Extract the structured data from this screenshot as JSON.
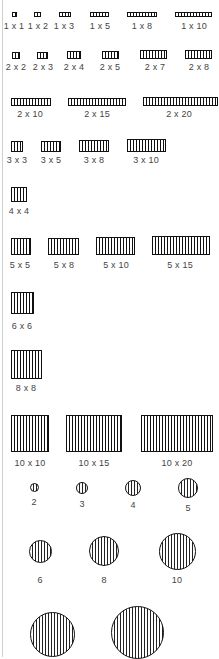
{
  "rects": [
    {
      "label": "1 x 1",
      "x": 12,
      "y": 12,
      "w": 5,
      "h": 5,
      "lx": 14,
      "ly": 21
    },
    {
      "label": "1 x 2",
      "x": 34,
      "y": 12,
      "w": 7,
      "h": 5,
      "lx": 38,
      "ly": 21
    },
    {
      "label": "1 x 3",
      "x": 59,
      "y": 12,
      "w": 12,
      "h": 5,
      "lx": 64,
      "ly": 21
    },
    {
      "label": "1 x 5",
      "x": 90,
      "y": 12,
      "w": 19,
      "h": 5,
      "lx": 100,
      "ly": 21
    },
    {
      "label": "1 x 8",
      "x": 127,
      "y": 12,
      "w": 30,
      "h": 5,
      "lx": 142,
      "ly": 21
    },
    {
      "label": "1 x 10",
      "x": 175,
      "y": 12,
      "w": 37,
      "h": 5,
      "lx": 194,
      "ly": 21
    },
    {
      "label": "2 x 2",
      "x": 12,
      "y": 52,
      "w": 8,
      "h": 7,
      "lx": 16,
      "ly": 62
    },
    {
      "label": "2 x 3",
      "x": 37,
      "y": 52,
      "w": 11,
      "h": 7,
      "lx": 43,
      "ly": 62
    },
    {
      "label": "2 x 4",
      "x": 67,
      "y": 51,
      "w": 14,
      "h": 8,
      "lx": 74,
      "ly": 62
    },
    {
      "label": "2 x 5",
      "x": 102,
      "y": 51,
      "w": 17,
      "h": 8,
      "lx": 110,
      "ly": 62
    },
    {
      "label": "2 x 7",
      "x": 140,
      "y": 50,
      "w": 27,
      "h": 9,
      "lx": 155,
      "ly": 62
    },
    {
      "label": "2 x 8",
      "x": 185,
      "y": 50,
      "w": 27,
      "h": 9,
      "lx": 199,
      "ly": 62
    },
    {
      "label": "2 x 10",
      "x": 11,
      "y": 98,
      "w": 40,
      "h": 8,
      "lx": 30,
      "ly": 109
    },
    {
      "label": "2 x 15",
      "x": 68,
      "y": 98,
      "w": 58,
      "h": 8,
      "lx": 97,
      "ly": 109
    },
    {
      "label": "2 x 20",
      "x": 143,
      "y": 97,
      "w": 75,
      "h": 9,
      "lx": 179,
      "ly": 109
    },
    {
      "label": "3 x 3",
      "x": 11,
      "y": 141,
      "w": 12,
      "h": 11,
      "lx": 17,
      "ly": 155
    },
    {
      "label": "3 x 5",
      "x": 41,
      "y": 141,
      "w": 20,
      "h": 11,
      "lx": 51,
      "ly": 155
    },
    {
      "label": "3 x 8",
      "x": 79,
      "y": 140,
      "w": 30,
      "h": 12,
      "lx": 94,
      "ly": 155
    },
    {
      "label": "3 x 10",
      "x": 127,
      "y": 139,
      "w": 39,
      "h": 13,
      "lx": 146,
      "ly": 155
    },
    {
      "label": "4 x 4",
      "x": 11,
      "y": 187,
      "w": 16,
      "h": 15,
      "lx": 19,
      "ly": 206
    },
    {
      "label": "5 x 5",
      "x": 11,
      "y": 238,
      "w": 20,
      "h": 17,
      "lx": 20,
      "ly": 260
    },
    {
      "label": "5 x 8",
      "x": 48,
      "y": 238,
      "w": 31,
      "h": 17,
      "lx": 64,
      "ly": 260
    },
    {
      "label": "5 x 10",
      "x": 96,
      "y": 237,
      "w": 39,
      "h": 18,
      "lx": 116,
      "ly": 260
    },
    {
      "label": "5 x 15",
      "x": 152,
      "y": 236,
      "w": 58,
      "h": 19,
      "lx": 180,
      "ly": 260
    },
    {
      "label": "6 x 6",
      "x": 11,
      "y": 292,
      "w": 23,
      "h": 22,
      "lx": 22,
      "ly": 321
    },
    {
      "label": "8 x 8",
      "x": 11,
      "y": 350,
      "w": 31,
      "h": 29,
      "lx": 26,
      "ly": 383
    },
    {
      "label": "10 x 10",
      "x": 11,
      "y": 415,
      "w": 38,
      "h": 37,
      "lx": 30,
      "ly": 458
    },
    {
      "label": "10 x 15",
      "x": 66,
      "y": 415,
      "w": 56,
      "h": 37,
      "lx": 94,
      "ly": 458
    },
    {
      "label": "10 x 20",
      "x": 141,
      "y": 415,
      "w": 72,
      "h": 37,
      "lx": 177,
      "ly": 458
    }
  ],
  "circles": [
    {
      "label": "2",
      "cx": 34,
      "cy": 487,
      "d": 9,
      "lx": 34,
      "ly": 497
    },
    {
      "label": "3",
      "cx": 82,
      "cy": 488,
      "d": 12,
      "lx": 82,
      "ly": 499
    },
    {
      "label": "4",
      "cx": 133,
      "cy": 488,
      "d": 16,
      "lx": 133,
      "ly": 500
    },
    {
      "label": "5",
      "cx": 188,
      "cy": 488,
      "d": 20,
      "lx": 188,
      "ly": 503
    },
    {
      "label": "6",
      "cx": 40,
      "cy": 551,
      "d": 23,
      "lx": 40,
      "ly": 575
    },
    {
      "label": "8",
      "cx": 104,
      "cy": 551,
      "d": 30,
      "lx": 104,
      "ly": 575
    },
    {
      "label": "10",
      "cx": 177,
      "cy": 551,
      "d": 37,
      "lx": 177,
      "ly": 575
    },
    {
      "label": "",
      "cx": 52,
      "cy": 634,
      "d": 45,
      "lx": 52,
      "ly": 660
    },
    {
      "label": "",
      "cx": 137,
      "cy": 632,
      "d": 53,
      "lx": 137,
      "ly": 660
    }
  ]
}
